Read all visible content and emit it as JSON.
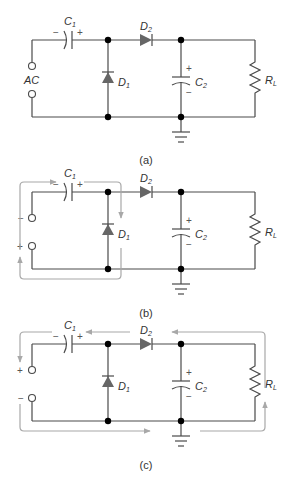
{
  "figure": {
    "panels": [
      {
        "id": "a",
        "caption": "(a)",
        "source_label": "AC",
        "source_top_sign": "",
        "source_bottom_sign": "",
        "labels": {
          "C1": "C",
          "C1_sub": "1",
          "D1": "D",
          "D1_sub": "1",
          "D2": "D",
          "D2_sub": "2",
          "C2": "C",
          "C2_sub": "2",
          "RL": "R",
          "RL_sub": "L"
        },
        "c1_polarity": {
          "left": "−",
          "right": "+"
        },
        "c2_polarity": {
          "top": "+",
          "bottom": "−"
        },
        "current_path": "none"
      },
      {
        "id": "b",
        "caption": "(b)",
        "source_label": "",
        "source_top_sign": "−",
        "source_bottom_sign": "+",
        "labels": {
          "C1": "C",
          "C1_sub": "1",
          "D1": "D",
          "D1_sub": "1",
          "D2": "D",
          "D2_sub": "2",
          "C2": "C",
          "C2_sub": "2",
          "RL": "R",
          "RL_sub": "L"
        },
        "c1_polarity": {
          "left": "−",
          "right": "+"
        },
        "c2_polarity": {
          "top": "+",
          "bottom": "−"
        },
        "current_path": "through C1 and D1 (charging C1)"
      },
      {
        "id": "c",
        "caption": "(c)",
        "source_label": "",
        "source_top_sign": "+",
        "source_bottom_sign": "−",
        "labels": {
          "C1": "C",
          "C1_sub": "1",
          "D1": "D",
          "D1_sub": "1",
          "D2": "D",
          "D2_sub": "2",
          "C2": "C",
          "C2_sub": "2",
          "RL": "R",
          "RL_sub": "L"
        },
        "c1_polarity": {
          "left": "−",
          "right": "+"
        },
        "c2_polarity": {
          "top": "+",
          "bottom": "−"
        },
        "current_path": "through RL, D2 and C1 (discharging)"
      }
    ],
    "colors": {
      "wire": "#4a4a4a",
      "diode": "#666666",
      "current_path": "#a8a8a8",
      "node": "#000000"
    }
  }
}
